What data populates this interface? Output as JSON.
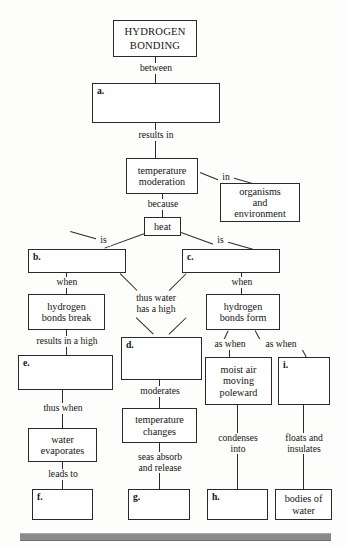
{
  "diagram": {
    "kind": "concept-map",
    "footer_rule_color": "#8a8a8a",
    "line_color": "#2a2a2a",
    "box_fill": "#ffffff"
  },
  "nodes": {
    "hydrogen_bonding": "HYDROGEN\nBONDING",
    "a": "a.",
    "temperature_moderation": "temperature\nmoderation",
    "organisms_and_environment": "organisms\nand\nenvironment",
    "heat": "heat",
    "b": "b.",
    "c": "c.",
    "hydrogen_bonds_break": "hydrogen\nbonds break",
    "hydrogen_bonds_form": "hydrogen\nbonds form",
    "d": "d.",
    "e": "e.",
    "moist_air_moving_poleward": "moist air\nmoving\npoleward",
    "i": "i.",
    "water_evaporates": "water\nevaporates",
    "temperature_changes": "temperature\nchanges",
    "f": "f.",
    "g": "g.",
    "h": "h.",
    "bodies_of_water": "bodies of\nwater"
  },
  "edge_labels": {
    "between": "between",
    "results_in": "results in",
    "because": "because",
    "in": "in",
    "is_left": "is",
    "is_right": "is",
    "when_left": "when",
    "when_right": "when",
    "thus_water_has_a_high": "thus water\nhas a high",
    "results_in_a_high": "results in a high",
    "as_when_left": "as when",
    "as_when_right": "as when",
    "thus_when": "thus when",
    "moderates": "moderates",
    "condenses_into": "condenses\ninto",
    "floats_and_insulates": "floats and\ninsulates",
    "leads_to": "leads to",
    "seas_absorb_and_release": "seas absorb\nand release"
  }
}
